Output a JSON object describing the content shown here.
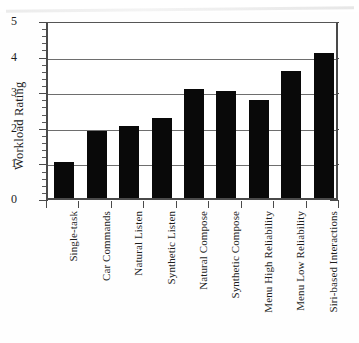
{
  "chart_data": {
    "type": "bar",
    "title": "",
    "subtitle": "",
    "xlabel": "",
    "ylabel": "Workload Rating",
    "ylim": [
      0,
      5
    ],
    "yticks": [
      0,
      1,
      2,
      3,
      4,
      5
    ],
    "ytick_labels": [
      "0",
      "1",
      "2",
      "3",
      "4",
      "5"
    ],
    "minor_tick_interval": 0.2,
    "grid": "horizontal",
    "legend": "none",
    "bar_color": "#090909",
    "categories": [
      "Single-task",
      "Car Commands",
      "Natural Listen",
      "Synthetic Listen",
      "Natural Compose",
      "Synthetic Compose",
      "Menu High Reliability",
      "Menu Low Reliability",
      "Siri-based Interactions"
    ],
    "values": [
      1.0,
      1.87,
      2.02,
      2.26,
      3.05,
      3.0,
      2.76,
      3.57,
      4.06
    ]
  },
  "axis": {
    "y_label": "Workload Rating"
  }
}
